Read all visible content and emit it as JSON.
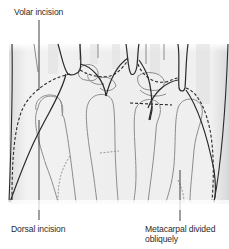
{
  "figure": {
    "type": "surgical-illustration",
    "colors": {
      "background": "#ffffff",
      "skin_shade": "#ececec",
      "skin_edge_shade": "#d6d6d6",
      "outline": "#2a2a2a",
      "bone_outline": "#8c8c8c",
      "incision_dashed": "#2a2a2a"
    }
  },
  "labels": {
    "volar_incision": "Volar incision",
    "dorsal_incision": "Dorsal incision",
    "metacarpal_divided": "Metacarpal divided obliquely"
  }
}
